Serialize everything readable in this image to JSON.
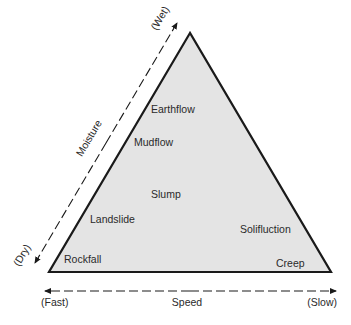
{
  "diagram": {
    "type": "ternary-style triangle classification",
    "colors": {
      "fill": "#e4e4e4",
      "stroke": "#1a1a1a",
      "text": "#2a2a2a"
    },
    "regions": [
      {
        "label": "Earthflow"
      },
      {
        "label": "Mudflow"
      },
      {
        "label": "Slump"
      },
      {
        "label": "Landslide"
      },
      {
        "label": "Solifluction"
      },
      {
        "label": "Rockfall"
      },
      {
        "label": "Creep"
      }
    ],
    "moisture_axis": {
      "title": "Moisture",
      "high_label": "(Wet)",
      "low_label": "(Dry)"
    },
    "speed_axis": {
      "title": "Speed",
      "left_label": "(Fast)",
      "right_label": "(Slow)"
    }
  }
}
